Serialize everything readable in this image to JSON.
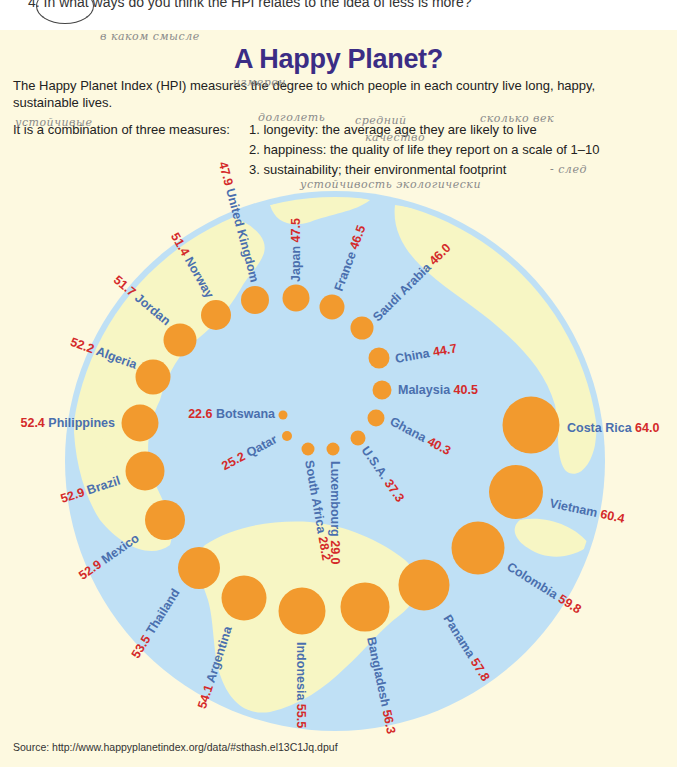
{
  "header": {
    "question": "4. In what ways do you think the HPI relates to the idea of less is more?",
    "title": "A Happy Planet?",
    "intro": "The Happy Planet Index (HPI) measures the degree to which people in each country live long, happy, sustainable lives.",
    "measures_lead": "It is a combination of three measures:",
    "measures": [
      "1. longevity: the average age they are likely to live",
      "2. happiness: the quality of life they report on a scale of 1–10",
      "3. sustainability; their environmental footprint"
    ]
  },
  "handwritten_notes": [
    {
      "text": "в каком смысле",
      "x": 100,
      "y": 30
    },
    {
      "text": "измерен",
      "x": 233,
      "y": 76
    },
    {
      "text": "устойчивые",
      "x": 15,
      "y": 116
    },
    {
      "text": "долголеть",
      "x": 258,
      "y": 111
    },
    {
      "text": "средний",
      "x": 355,
      "y": 114
    },
    {
      "text": "сколько век",
      "x": 480,
      "y": 112
    },
    {
      "text": "качество",
      "x": 365,
      "y": 131
    },
    {
      "text": "- след",
      "x": 550,
      "y": 163
    },
    {
      "text": "устойчивость экологически",
      "x": 300,
      "y": 178
    }
  ],
  "colors": {
    "title": "#3b2d85",
    "panel_bg": "#fdf9e0",
    "ocean": "#bfe0f5",
    "land": "#f7f6c4",
    "bubble": "#f29a2e",
    "country_label": "#4a6fae",
    "value_label": "#d42a2a"
  },
  "source": "Source: http://www.happyplanetindex.org/data/#sthash.el13C1Jq.dpuf",
  "chart_data": {
    "type": "bubble-ring",
    "title": "A Happy Planet?",
    "categories": [
      "Botswana",
      "Qatar",
      "South Africa",
      "Luxembourg",
      "U.S.A.",
      "Ghana",
      "Malaysia",
      "China",
      "Saudi Arabia",
      "France",
      "Japan",
      "United Kingdom",
      "Norway",
      "Jordan",
      "Algeria",
      "Philippines",
      "Brazil",
      "Mexico",
      "Thailand",
      "Argentina",
      "Indonesia",
      "Bangladesh",
      "Panama",
      "Colombia",
      "Vietnam",
      "Costa Rica"
    ],
    "values": [
      22.6,
      25.2,
      28.2,
      29.0,
      37.3,
      40.3,
      40.5,
      44.7,
      46.0,
      46.5,
      47.5,
      47.9,
      51.4,
      51.7,
      52.2,
      52.4,
      52.9,
      52.9,
      53.5,
      54.1,
      55.5,
      56.3,
      57.8,
      59.8,
      60.4,
      64.0
    ],
    "points": [
      {
        "country": "Botswana",
        "value": "22.6",
        "cx": 283,
        "cy": 415,
        "r": 4.5,
        "lx": 275,
        "ly": 418,
        "angle": 0,
        "anchor": "end",
        "order": "value-first"
      },
      {
        "country": "Qatar",
        "value": "25.2",
        "cx": 287,
        "cy": 436,
        "r": 5,
        "lx": 278,
        "ly": 442,
        "angle": -28,
        "anchor": "end",
        "order": "value-first"
      },
      {
        "country": "South Africa",
        "value": "28.2",
        "cx": 308,
        "cy": 449,
        "r": 6.5,
        "lx": 305,
        "ly": 461,
        "angle": 80,
        "anchor": "start",
        "order": "name-first"
      },
      {
        "country": "Luxembourg",
        "value": "29.0",
        "cx": 333,
        "cy": 449,
        "r": 6.5,
        "lx": 331,
        "ly": 461,
        "angle": 90,
        "anchor": "start",
        "order": "name-first"
      },
      {
        "country": "U.S.A.",
        "value": "37.3",
        "cx": 358,
        "cy": 438,
        "r": 7.5,
        "lx": 361,
        "ly": 450,
        "angle": 55,
        "anchor": "start",
        "order": "name-first"
      },
      {
        "country": "Ghana",
        "value": "40.3",
        "cx": 376,
        "cy": 418,
        "r": 8.5,
        "lx": 389,
        "ly": 424,
        "angle": 28,
        "anchor": "start",
        "order": "name-first"
      },
      {
        "country": "Malaysia",
        "value": "40.5",
        "cx": 382,
        "cy": 390,
        "r": 9.5,
        "lx": 398,
        "ly": 394,
        "angle": 0,
        "anchor": "start",
        "order": "name-first"
      },
      {
        "country": "China",
        "value": "44.7",
        "cx": 379,
        "cy": 358,
        "r": 10.5,
        "lx": 396,
        "ly": 363,
        "angle": -10,
        "anchor": "start",
        "order": "name-first"
      },
      {
        "country": "Saudi Arabia",
        "value": "46.0",
        "cx": 362,
        "cy": 328,
        "r": 11.5,
        "lx": 378,
        "ly": 322,
        "angle": -45,
        "anchor": "start",
        "order": "name-first"
      },
      {
        "country": "France",
        "value": "46.5",
        "cx": 332,
        "cy": 307,
        "r": 12.5,
        "lx": 342,
        "ly": 292,
        "angle": -70,
        "anchor": "start",
        "order": "name-first"
      },
      {
        "country": "Japan",
        "value": "47.5",
        "cx": 296,
        "cy": 298,
        "r": 13.5,
        "lx": 300,
        "ly": 282,
        "angle": -90,
        "anchor": "start",
        "order": "name-first"
      },
      {
        "country": "United Kingdom",
        "value": "47.9",
        "cx": 255,
        "cy": 300,
        "r": 14,
        "lx": 251,
        "ly": 283,
        "angle": -105,
        "anchor": "end",
        "order": "value-first",
        "rot_from": "end"
      },
      {
        "country": "Norway",
        "value": "51.4",
        "cx": 216,
        "cy": 315,
        "r": 15,
        "lx": 207,
        "ly": 299,
        "angle": -120,
        "anchor": "end",
        "order": "value-first"
      },
      {
        "country": "Jordan",
        "value": "51.7",
        "cx": 180,
        "cy": 340,
        "r": 16.5,
        "lx": 166,
        "ly": 326,
        "angle": -140,
        "anchor": "end",
        "order": "value-first"
      },
      {
        "country": "Algeria",
        "value": "52.2",
        "cx": 153,
        "cy": 377,
        "r": 17.5,
        "lx": 135,
        "ly": 369,
        "angle": -160,
        "anchor": "end",
        "order": "value-first"
      },
      {
        "country": "Philippines",
        "value": "52.4",
        "cx": 140,
        "cy": 423,
        "r": 18.5,
        "lx": 115,
        "ly": 427,
        "angle": 0,
        "anchor": "end",
        "order": "value-first"
      },
      {
        "country": "Brazil",
        "value": "52.9",
        "cx": 145,
        "cy": 471,
        "r": 19.5,
        "lx": 121,
        "ly": 484,
        "angle": -18,
        "anchor": "end",
        "order": "value-first"
      },
      {
        "country": "Mexico",
        "value": "52.9",
        "cx": 165,
        "cy": 520,
        "r": 20,
        "lx": 140,
        "ly": 540,
        "angle": -35,
        "anchor": "end",
        "order": "value-first"
      },
      {
        "country": "Thailand",
        "value": "53.5",
        "cx": 199,
        "cy": 568,
        "r": 21,
        "lx": 180,
        "ly": 592,
        "angle": -58,
        "anchor": "end",
        "order": "value-first"
      },
      {
        "country": "Argentina",
        "value": "54.1",
        "cx": 244,
        "cy": 598,
        "r": 22.5,
        "lx": 232,
        "ly": 628,
        "angle": -72,
        "anchor": "end",
        "order": "value-first"
      },
      {
        "country": "Indonesia",
        "value": "55.5",
        "cx": 302,
        "cy": 611,
        "r": 23.5,
        "lx": 297,
        "ly": 642,
        "angle": 90,
        "anchor": "start",
        "order": "name-first"
      },
      {
        "country": "Bangladesh",
        "value": "56.3",
        "cx": 365,
        "cy": 607,
        "r": 24.5,
        "lx": 367,
        "ly": 638,
        "angle": 78,
        "anchor": "start",
        "order": "name-first"
      },
      {
        "country": "Panama",
        "value": "57.8",
        "cx": 424,
        "cy": 585,
        "r": 25.5,
        "lx": 443,
        "ly": 618,
        "angle": 58,
        "anchor": "start",
        "order": "name-first"
      },
      {
        "country": "Colombia",
        "value": "59.8",
        "cx": 478,
        "cy": 548,
        "r": 26.5,
        "lx": 506,
        "ly": 569,
        "angle": 32,
        "anchor": "start",
        "order": "name-first"
      },
      {
        "country": "Vietnam",
        "value": "60.4",
        "cx": 516,
        "cy": 492,
        "r": 27,
        "lx": 549,
        "ly": 507,
        "angle": 12,
        "anchor": "start",
        "order": "name-first"
      },
      {
        "country": "Costa Rica",
        "value": "64.0",
        "cx": 531,
        "cy": 425,
        "r": 28.5,
        "lx": 567,
        "ly": 432,
        "angle": 0,
        "anchor": "start",
        "order": "name-first"
      }
    ],
    "globe": {
      "cx": 335,
      "cy": 461,
      "r": 270
    },
    "xlabel": "",
    "ylabel": "",
    "legend": "none"
  }
}
